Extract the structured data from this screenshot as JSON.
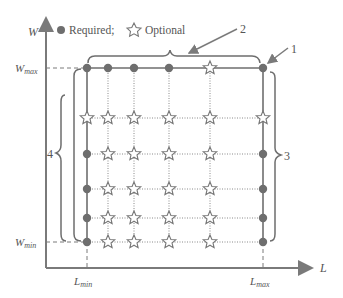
{
  "axes": {
    "y_label": "W",
    "x_label": "L",
    "w_max": {
      "base": "W",
      "sub": "max"
    },
    "w_min": {
      "base": "W",
      "sub": "min"
    },
    "l_min": {
      "base": "L",
      "sub": "min"
    },
    "l_max": {
      "base": "L",
      "sub": "max"
    }
  },
  "legend": {
    "required_label": "Required;",
    "optional_label": "Optional"
  },
  "callouts": {
    "c1": "1",
    "c2": "2",
    "c3": "3",
    "c4": "4"
  },
  "colors": {
    "stroke": "#6e6e6e",
    "dot": "#6e6e6e",
    "star_fill": "#ffffff"
  },
  "grid": {
    "columns_x": [
      87,
      108,
      134,
      169,
      210,
      263
    ],
    "rows_y": [
      68,
      118,
      154,
      189,
      218,
      242
    ],
    "cells": [
      [
        "R",
        "R",
        "R",
        "R",
        "O",
        "R"
      ],
      [
        "O",
        "O",
        "O",
        "O",
        "O",
        "O"
      ],
      [
        "R",
        "O",
        "O",
        "O",
        "O",
        "R"
      ],
      [
        "R",
        "O",
        "O",
        "O",
        "O",
        "R"
      ],
      [
        "R",
        "O",
        "O",
        "O",
        "O",
        "R"
      ],
      [
        "R",
        "O",
        "O",
        "O",
        "O",
        "R"
      ]
    ]
  }
}
